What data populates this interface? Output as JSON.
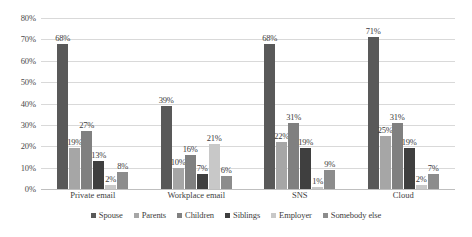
{
  "chart_data": {
    "type": "bar",
    "title": "",
    "xlabel": "",
    "ylabel": "",
    "ylim": [
      0,
      80
    ],
    "ytick_labels": [
      "0%",
      "10%",
      "20%",
      "30%",
      "40%",
      "50%",
      "60%",
      "70%",
      "80%"
    ],
    "ytick_values": [
      0,
      10,
      20,
      30,
      40,
      50,
      60,
      70,
      80
    ],
    "grid": true,
    "legend_position": "bottom",
    "value_labels": true,
    "value_label_suffix": "%",
    "categories": [
      "Private email",
      "Workplace email",
      "SNS",
      "Cloud"
    ],
    "series": [
      {
        "name": "Spouse",
        "color": "#595959",
        "values": [
          68,
          39,
          68,
          71
        ],
        "labels": [
          "68%",
          "39%",
          "68%",
          "71%"
        ]
      },
      {
        "name": "Parents",
        "color": "#a6a6a6",
        "values": [
          19,
          10,
          22,
          25
        ],
        "labels": [
          "19%",
          "10%",
          "22%",
          "25%"
        ]
      },
      {
        "name": "Children",
        "color": "#808080",
        "values": [
          27,
          16,
          31,
          31
        ],
        "labels": [
          "27%",
          "16%",
          "31%",
          "31%"
        ]
      },
      {
        "name": "Siblings",
        "color": "#3f3f3f",
        "values": [
          13,
          7,
          19,
          19
        ],
        "labels": [
          "13%",
          "7%",
          "19%",
          "19%"
        ]
      },
      {
        "name": "Employer",
        "color": "#c8c8c8",
        "values": [
          2,
          21,
          1,
          2
        ],
        "labels": [
          "2%",
          "21%",
          "1%",
          "2%"
        ]
      },
      {
        "name": "Somebody else",
        "color": "#8c8c8c",
        "values": [
          8,
          6,
          9,
          7
        ],
        "labels": [
          "8%",
          "6%",
          "9%",
          "7%"
        ]
      }
    ]
  }
}
